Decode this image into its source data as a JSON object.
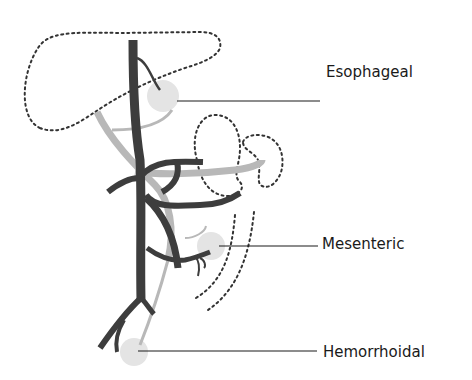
{
  "diagram": {
    "labels": {
      "esophageal": "Esophageal",
      "mesenteric": "Mesenteric",
      "hemorrhoidal": "Hemorrhoidal"
    },
    "colors": {
      "portal_vein": "#3d3d3d",
      "systemic_vein": "#b8b8b8",
      "anastomosis_site": "#e4e4e4",
      "organ_outline": "#333333",
      "leader_line": "#1a1a1a",
      "label_text": "#1a1a1a"
    }
  }
}
